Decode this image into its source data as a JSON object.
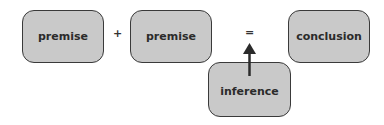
{
  "diagram": {
    "nodes": [
      {
        "id": "premise1",
        "label": "premise"
      },
      {
        "id": "premise2",
        "label": "premise"
      },
      {
        "id": "conclusion",
        "label": "conclusion"
      },
      {
        "id": "inference",
        "label": "inference"
      }
    ],
    "operators": {
      "plus": "+",
      "equals": "="
    },
    "edges": [
      {
        "from": "inference",
        "to": "equals",
        "type": "arrow"
      }
    ],
    "colors": {
      "box_fill": "#c9c9c9",
      "box_border": "#3a3a3a",
      "text": "#2b2b2b"
    }
  }
}
